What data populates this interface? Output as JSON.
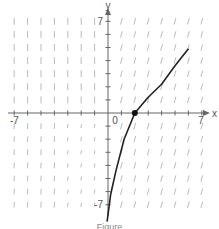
{
  "chart_data": {
    "type": "line",
    "title": "",
    "subtitle": "slope field with solution curve",
    "xlabel": "x",
    "ylabel": "y",
    "xlim": [
      -7,
      7
    ],
    "ylim": [
      -7,
      7
    ],
    "x_tick_labels": [
      "-7",
      "0",
      "7"
    ],
    "y_tick_labels": [
      "7",
      "-7"
    ],
    "origin_label": "0",
    "grid": false,
    "legend": null,
    "series": [
      {
        "name": "solution curve",
        "x": [
          -0.07,
          0.2,
          0.6,
          1.2,
          2.0,
          3.0,
          4.0,
          5.0,
          6.0
        ],
        "y": [
          -8.3,
          -6.2,
          -4.4,
          -2.0,
          0.0,
          1.2,
          2.2,
          3.6,
          4.9
        ]
      }
    ],
    "marked_point": {
      "x": 2,
      "y": 0
    },
    "slope_field": "short line segments at every integer grid point from -7 to 7; steep near-vertical at left, shallower near origin, positive slopes lower-right"
  },
  "caption": "Figure"
}
